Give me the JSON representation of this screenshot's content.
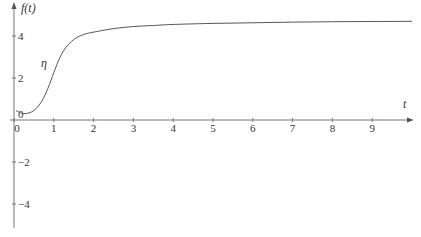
{
  "chart_data": {
    "type": "line",
    "title": "",
    "xlabel": "t",
    "ylabel": "f(t)",
    "xlim": [
      0,
      10
    ],
    "ylim": [
      -5,
      5
    ],
    "grid": false,
    "legend": null,
    "x_ticks": [
      0,
      1,
      2,
      3,
      4,
      5,
      6,
      7,
      8,
      9
    ],
    "x_tick_labels": [
      "0",
      "1",
      "2",
      "3",
      "4",
      "5",
      "6",
      "7",
      "8",
      "9"
    ],
    "y_ticks": [
      4,
      2,
      0,
      -2,
      -4
    ],
    "y_tick_labels": [
      "4",
      "2",
      "0",
      "−2",
      "−4"
    ],
    "annotations": [
      {
        "text": "η",
        "x": 0.75,
        "y": 2.6
      }
    ],
    "series": [
      {
        "name": "η",
        "x": [
          0.05,
          0.25,
          0.5,
          0.7,
          0.85,
          1.0,
          1.1,
          1.2,
          1.3,
          1.45,
          1.6,
          1.8,
          2.1,
          2.5,
          3.0,
          3.5,
          4.0,
          5.0,
          6.0,
          7.0,
          8.0,
          9.0,
          10.0
        ],
        "values": [
          0.45,
          0.3,
          0.45,
          0.9,
          1.5,
          2.25,
          2.75,
          3.15,
          3.45,
          3.75,
          3.95,
          4.1,
          4.22,
          4.35,
          4.45,
          4.5,
          4.55,
          4.6,
          4.63,
          4.66,
          4.68,
          4.69,
          4.7
        ]
      }
    ]
  },
  "plot": {
    "origin_px": [
      14,
      120
    ],
    "px_per_x": 39.8,
    "px_per_y": 21,
    "color": "#555555"
  }
}
